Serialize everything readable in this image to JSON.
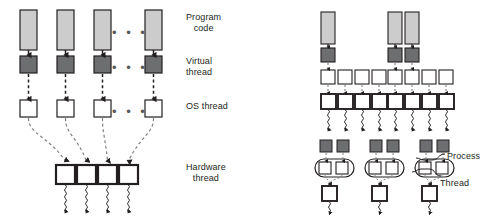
{
  "figure": {
    "colors": {
      "program_code_fill": "#cccccc",
      "virtual_thread_fill": "#6d6e70",
      "os_thread_fill": "#ffffff",
      "hardware_thread_fill": "#ffffff",
      "stroke_dark": "#231f20",
      "stroke_gray": "#808285",
      "text": "#231f20",
      "background": "#ffffff"
    },
    "left_panel": {
      "labels": [
        {
          "id": "program-code",
          "text": "Program\ncode",
          "x": 186,
          "y": 12
        },
        {
          "id": "virtual-thread",
          "text": "Virtual\nthread",
          "x": 186,
          "y": 56
        },
        {
          "id": "os-thread",
          "text": "OS thread",
          "x": 186,
          "y": 101
        },
        {
          "id": "hardware-thread",
          "text": "Hardware\nthread",
          "x": 186,
          "y": 162
        }
      ],
      "ellipsis": {
        "text": "• • •",
        "x": 112,
        "y": 28
      },
      "ellipsis2": {
        "text": "• • •",
        "x": 112,
        "y": 63
      },
      "ellipsis3": {
        "text": "• • •",
        "x": 112,
        "y": 107
      },
      "program_code_boxes": [
        {
          "x": 20,
          "y": 10,
          "w": 17,
          "h": 40
        },
        {
          "x": 57,
          "y": 10,
          "w": 17,
          "h": 40
        },
        {
          "x": 94,
          "y": 10,
          "w": 17,
          "h": 40
        },
        {
          "x": 145,
          "y": 10,
          "w": 17,
          "h": 40
        }
      ],
      "virtual_thread_boxes": [
        {
          "x": 20,
          "y": 56,
          "w": 17,
          "h": 17
        },
        {
          "x": 57,
          "y": 56,
          "w": 17,
          "h": 17
        },
        {
          "x": 94,
          "y": 56,
          "w": 17,
          "h": 17
        },
        {
          "x": 145,
          "y": 56,
          "w": 17,
          "h": 17
        }
      ],
      "os_thread_boxes": [
        {
          "x": 20,
          "y": 100,
          "w": 17,
          "h": 17
        },
        {
          "x": 57,
          "y": 100,
          "w": 17,
          "h": 17
        },
        {
          "x": 94,
          "y": 100,
          "w": 17,
          "h": 17
        },
        {
          "x": 145,
          "y": 100,
          "w": 17,
          "h": 17
        }
      ],
      "hardware_thread_boxes": [
        {
          "x": 56,
          "y": 165,
          "w": 19,
          "h": 19
        },
        {
          "x": 77,
          "y": 165,
          "w": 19,
          "h": 19
        },
        {
          "x": 98,
          "y": 165,
          "w": 19,
          "h": 19
        },
        {
          "x": 119,
          "y": 165,
          "w": 19,
          "h": 19
        }
      ]
    },
    "right_panel": {
      "labels": [
        {
          "id": "process",
          "text": "Process",
          "x": 447,
          "y": 151
        },
        {
          "id": "thread",
          "text": "Thread",
          "x": 440,
          "y": 178
        }
      ],
      "group_a": {
        "program_code_boxes": [
          {
            "x": 321,
            "y": 12,
            "w": 14,
            "h": 32
          }
        ],
        "virtual_thread_boxes": [
          {
            "x": 321,
            "y": 48,
            "w": 14,
            "h": 14
          }
        ],
        "os_thread_boxes": [
          {
            "x": 321,
            "y": 70,
            "w": 14,
            "h": 14
          },
          {
            "x": 338,
            "y": 70,
            "w": 14,
            "h": 14
          },
          {
            "x": 355,
            "y": 70,
            "w": 14,
            "h": 14
          },
          {
            "x": 372,
            "y": 70,
            "w": 14,
            "h": 14
          }
        ],
        "hardware_thread_boxes": [
          {
            "x": 321,
            "y": 94,
            "w": 15,
            "h": 15
          },
          {
            "x": 338,
            "y": 94,
            "w": 15,
            "h": 15
          },
          {
            "x": 355,
            "y": 94,
            "w": 15,
            "h": 15
          },
          {
            "x": 372,
            "y": 94,
            "w": 15,
            "h": 15
          }
        ]
      },
      "group_b": {
        "program_code_boxes": [
          {
            "x": 388,
            "y": 12,
            "w": 14,
            "h": 32
          },
          {
            "x": 405,
            "y": 12,
            "w": 14,
            "h": 32
          }
        ],
        "virtual_thread_boxes": [
          {
            "x": 388,
            "y": 48,
            "w": 14,
            "h": 14
          },
          {
            "x": 405,
            "y": 48,
            "w": 14,
            "h": 14
          }
        ],
        "os_thread_boxes": [
          {
            "x": 388,
            "y": 70,
            "w": 14,
            "h": 14
          },
          {
            "x": 405,
            "y": 70,
            "w": 14,
            "h": 14
          },
          {
            "x": 422,
            "y": 70,
            "w": 14,
            "h": 14
          },
          {
            "x": 439,
            "y": 70,
            "w": 14,
            "h": 14
          }
        ],
        "hardware_thread_boxes": [
          {
            "x": 388,
            "y": 94,
            "w": 15,
            "h": 15
          },
          {
            "x": 405,
            "y": 94,
            "w": 15,
            "h": 15
          },
          {
            "x": 422,
            "y": 94,
            "w": 15,
            "h": 15
          },
          {
            "x": 439,
            "y": 94,
            "w": 15,
            "h": 15
          }
        ]
      },
      "process_groups": [
        {
          "id": "process-1",
          "x": 320,
          "y": 140
        },
        {
          "id": "process-2",
          "x": 370,
          "y": 140
        },
        {
          "id": "process-3",
          "x": 420,
          "y": 140
        }
      ]
    }
  }
}
